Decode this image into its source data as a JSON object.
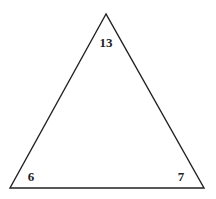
{
  "diagram": {
    "shape": "triangle",
    "stroke_color": "#222222",
    "background": "#ffffff",
    "vertices": {
      "top": {
        "label": "13"
      },
      "bottom_left": {
        "label": "6"
      },
      "bottom_right": {
        "label": "7"
      }
    }
  }
}
